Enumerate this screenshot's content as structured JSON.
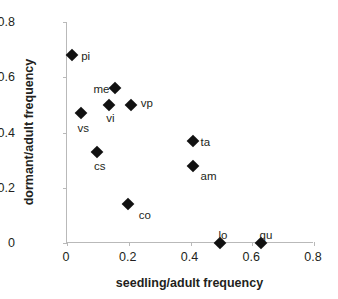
{
  "chart_data": {
    "type": "scatter",
    "title": "",
    "xlabel": "seedling/adult frequency",
    "ylabel": "dormant/adult frequency",
    "xlim": [
      0,
      0.8
    ],
    "ylim": [
      0,
      0.8
    ],
    "xticks": [
      "0",
      "0.2",
      "0.4",
      "0.6",
      "0.8"
    ],
    "xtick_values": [
      0,
      0.2,
      0.4,
      0.6,
      0.8
    ],
    "yticks": [
      "0",
      "0.2",
      "0.4",
      "0.6",
      "0.8"
    ],
    "ytick_values": [
      0,
      0.2,
      0.4,
      0.6,
      0.8
    ],
    "grid": false,
    "legend": false,
    "marker": "filled-diamond",
    "marker_color": "#111111",
    "points": [
      {
        "label": "pi",
        "x": 0.02,
        "y": 0.68,
        "label_dx": 9,
        "label_dy": -4
      },
      {
        "label": "me",
        "x": 0.16,
        "y": 0.56,
        "label_dx": -22,
        "label_dy": -4
      },
      {
        "label": "vp",
        "x": 0.21,
        "y": 0.5,
        "label_dx": 10,
        "label_dy": -7
      },
      {
        "label": "vi",
        "x": 0.14,
        "y": 0.5,
        "label_dx": -3,
        "label_dy": 8
      },
      {
        "label": "vs",
        "x": 0.05,
        "y": 0.47,
        "label_dx": -4,
        "label_dy": 10
      },
      {
        "label": "cs",
        "x": 0.1,
        "y": 0.33,
        "label_dx": -3,
        "label_dy": 9
      },
      {
        "label": "ta",
        "x": 0.41,
        "y": 0.37,
        "label_dx": 8,
        "label_dy": -4
      },
      {
        "label": "am",
        "x": 0.41,
        "y": 0.28,
        "label_dx": 8,
        "label_dy": 5
      },
      {
        "label": "co",
        "x": 0.2,
        "y": 0.14,
        "label_dx": 11,
        "label_dy": 6
      },
      {
        "label": "lo",
        "x": 0.5,
        "y": 0.0,
        "label_dx": -2,
        "label_dy": -13
      },
      {
        "label": "qu",
        "x": 0.63,
        "y": 0.0,
        "label_dx": -1,
        "label_dy": -13
      }
    ]
  }
}
